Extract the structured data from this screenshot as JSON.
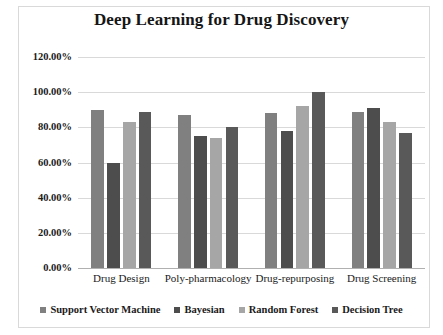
{
  "chart_data": {
    "type": "bar",
    "title": "Deep Learning for Drug Discovery",
    "xlabel": "",
    "ylabel": "",
    "categories": [
      "Drug Design",
      "Poly-pharmacology",
      "Drug-repurposing",
      "Drug Screening"
    ],
    "series": [
      {
        "name": "Support Vector Machine",
        "color": "#808080",
        "values": [
          90.0,
          87.0,
          88.0,
          89.0
        ]
      },
      {
        "name": "Bayesian",
        "color": "#4d4d4d",
        "values": [
          60.0,
          75.0,
          78.0,
          91.0
        ]
      },
      {
        "name": "Random Forest",
        "color": "#a6a6a6",
        "values": [
          83.0,
          74.0,
          92.0,
          83.0
        ]
      },
      {
        "name": "Decision Tree",
        "color": "#595959",
        "values": [
          89.0,
          80.0,
          100.0,
          77.0
        ]
      }
    ],
    "ylim": [
      0,
      120
    ],
    "ytick_values": [
      0,
      20,
      40,
      60,
      80,
      100,
      120
    ],
    "ytick_labels": [
      "0.00%",
      "20.00%",
      "40.00%",
      "60.00%",
      "80.00%",
      "100.00%",
      "120.00%"
    ],
    "grid": true,
    "legend_position": "bottom"
  }
}
